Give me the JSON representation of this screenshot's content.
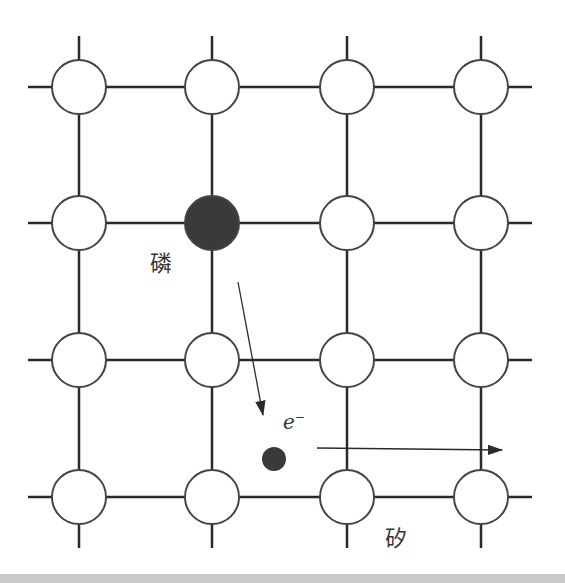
{
  "diagram": {
    "title": "",
    "colors": {
      "line": "#2a2a2a",
      "atom_fill": "#ffffff",
      "dopant_fill": "#3a3a3a",
      "electron_fill": "#3a3a3a",
      "bottom_band": "#c9c9c9"
    },
    "grid": {
      "columns_x": [
        79,
        212,
        347,
        481
      ],
      "rows_y": [
        87,
        223,
        360,
        497
      ],
      "atom_radius": 27
    },
    "dopant": {
      "label": "磷",
      "row": 1,
      "col": 1
    },
    "electron": {
      "label": "e",
      "charge": "−",
      "x": 274,
      "y": 459,
      "radius": 12
    },
    "host_label": "矽",
    "arrows": [
      {
        "name": "dopant-to-electron",
        "x1": 238,
        "y1": 282,
        "x2": 263,
        "y2": 415
      },
      {
        "name": "electron-drift",
        "x1": 317,
        "y1": 448,
        "x2": 502,
        "y2": 450
      }
    ]
  }
}
